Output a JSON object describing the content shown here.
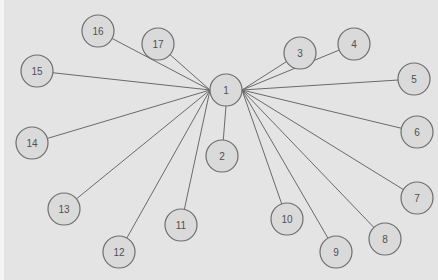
{
  "diagram": {
    "type": "star-graph",
    "colors": {
      "background": "#e4e4e4",
      "node_fill": "#dadada",
      "node_stroke": "#6e6e6e",
      "edge": "#6a6a6a",
      "label": "#505050"
    },
    "node_radius": 16,
    "hub": "1",
    "nodes": [
      {
        "id": "1",
        "label": "1",
        "x": 222,
        "y": 90
      },
      {
        "id": "2",
        "label": "2",
        "x": 218,
        "y": 156
      },
      {
        "id": "3",
        "label": "3",
        "x": 296,
        "y": 53
      },
      {
        "id": "4",
        "label": "4",
        "x": 350,
        "y": 44
      },
      {
        "id": "5",
        "label": "5",
        "x": 410,
        "y": 79
      },
      {
        "id": "6",
        "label": "6",
        "x": 413,
        "y": 132
      },
      {
        "id": "7",
        "label": "7",
        "x": 413,
        "y": 198
      },
      {
        "id": "8",
        "label": "8",
        "x": 381,
        "y": 239
      },
      {
        "id": "9",
        "label": "9",
        "x": 332,
        "y": 252
      },
      {
        "id": "10",
        "label": "10",
        "x": 283,
        "y": 219
      },
      {
        "id": "11",
        "label": "11",
        "x": 177,
        "y": 225
      },
      {
        "id": "12",
        "label": "12",
        "x": 115,
        "y": 252
      },
      {
        "id": "13",
        "label": "13",
        "x": 60,
        "y": 209
      },
      {
        "id": "14",
        "label": "14",
        "x": 28,
        "y": 143
      },
      {
        "id": "15",
        "label": "15",
        "x": 33,
        "y": 71
      },
      {
        "id": "16",
        "label": "16",
        "x": 94,
        "y": 31
      },
      {
        "id": "17",
        "label": "17",
        "x": 154,
        "y": 44
      }
    ],
    "edges": [
      {
        "from": "1",
        "to": "2"
      },
      {
        "from": "1",
        "to": "3"
      },
      {
        "from": "1",
        "to": "4"
      },
      {
        "from": "1",
        "to": "5"
      },
      {
        "from": "1",
        "to": "6"
      },
      {
        "from": "1",
        "to": "7"
      },
      {
        "from": "1",
        "to": "8"
      },
      {
        "from": "1",
        "to": "9"
      },
      {
        "from": "1",
        "to": "10"
      },
      {
        "from": "1",
        "to": "11"
      },
      {
        "from": "1",
        "to": "12"
      },
      {
        "from": "1",
        "to": "13"
      },
      {
        "from": "1",
        "to": "14"
      },
      {
        "from": "1",
        "to": "15"
      },
      {
        "from": "1",
        "to": "16"
      },
      {
        "from": "1",
        "to": "17"
      }
    ]
  }
}
